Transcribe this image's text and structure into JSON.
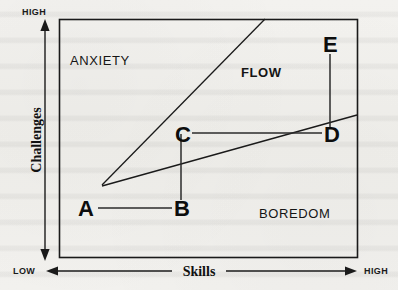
{
  "figure": {
    "type": "diagram"
  },
  "axes": {
    "vertical": {
      "title": "Challenges",
      "high_label": "HIGH",
      "low_label": "LOW",
      "direction": "bidirectional-vertical"
    },
    "horizontal": {
      "title": "Skills",
      "low_label": "LOW",
      "high_label": "HIGH",
      "direction": "bidirectional-horizontal"
    }
  },
  "zones": [
    {
      "name": "anxiety",
      "label": "ANXIETY",
      "weight": "regular",
      "x": 70,
      "y": 65
    },
    {
      "name": "flow",
      "label": "FLOW",
      "weight": "bold",
      "x": 241,
      "y": 77
    },
    {
      "name": "boredom",
      "label": "BOREDOM",
      "weight": "regular",
      "x": 259,
      "y": 218
    }
  ],
  "points": [
    {
      "id": "A",
      "label": "A",
      "x": 86,
      "y": 212
    },
    {
      "id": "B",
      "label": "B",
      "x": 180,
      "y": 212
    },
    {
      "id": "C",
      "label": "C",
      "x": 181,
      "y": 139
    },
    {
      "id": "D",
      "label": "D",
      "x": 331,
      "y": 139
    },
    {
      "id": "E",
      "label": "E",
      "x": 330,
      "y": 48
    }
  ],
  "connections": [
    {
      "name": "a-to-b",
      "from": "A",
      "to": "B"
    },
    {
      "name": "b-to-c",
      "from": "B",
      "to": "C"
    },
    {
      "name": "c-to-d",
      "from": "C",
      "to": "D"
    },
    {
      "name": "d-to-e",
      "from": "D",
      "to": "E"
    }
  ],
  "boundaries": [
    {
      "name": "anxiety-flow-boundary",
      "description": "upper diagonal separating ANXIETY from FLOW"
    },
    {
      "name": "flow-boredom-boundary",
      "description": "lower diagonal separating FLOW from BOREDOM"
    }
  ],
  "colors": {
    "ink": "#111111",
    "paper": "#f1f0ed",
    "line": "#1a1a1a"
  }
}
